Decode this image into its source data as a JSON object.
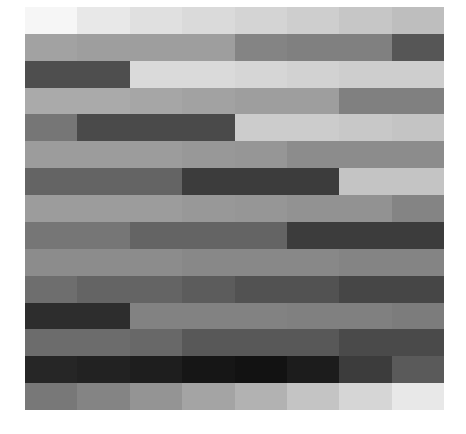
{
  "chart_data": {
    "type": "heatmap",
    "title": "",
    "xlabel": "",
    "ylabel": "",
    "colormap": "grayscale",
    "value_range": [
      0,
      255
    ],
    "n_rows": 15,
    "n_cols": 8,
    "grid": false,
    "legend": "none",
    "values": [
      [
        246,
        232,
        224,
        218,
        212,
        206,
        198,
        190
      ],
      [
        162,
        158,
        158,
        158,
        132,
        128,
        128,
        86
      ],
      [
        78,
        78,
        218,
        218,
        214,
        210,
        206,
        206
      ],
      [
        170,
        170,
        166,
        162,
        158,
        158,
        128,
        128
      ],
      [
        118,
        74,
        74,
        74,
        204,
        204,
        200,
        196
      ],
      [
        156,
        156,
        156,
        152,
        150,
        140,
        140,
        140
      ],
      [
        100,
        100,
        100,
        60,
        60,
        60,
        196,
        196
      ],
      [
        156,
        156,
        156,
        152,
        150,
        146,
        146,
        132
      ],
      [
        118,
        118,
        100,
        100,
        100,
        60,
        60,
        60
      ],
      [
        140,
        140,
        140,
        136,
        136,
        136,
        132,
        132
      ],
      [
        110,
        100,
        100,
        92,
        82,
        82,
        70,
        70
      ],
      [
        45,
        45,
        130,
        130,
        130,
        128,
        128,
        124
      ],
      [
        108,
        108,
        104,
        88,
        88,
        88,
        74,
        74
      ],
      [
        38,
        34,
        30,
        22,
        18,
        28,
        60,
        90
      ],
      [
        120,
        132,
        148,
        164,
        178,
        196,
        214,
        232
      ]
    ]
  }
}
